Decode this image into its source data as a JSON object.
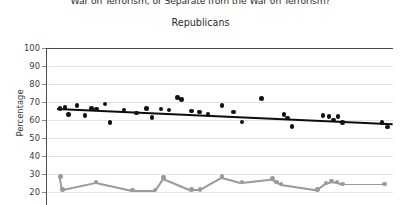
{
  "chart_data": {
    "type": "scatter",
    "title": "War on Terrorism, or Separate from the War on Terrorism?",
    "subtitle": "Republicans",
    "xlabel": "",
    "ylabel": "Percentage",
    "ylim": [
      20,
      100
    ],
    "yticks": [
      100,
      90,
      80,
      70,
      60,
      50,
      40,
      30,
      20
    ],
    "ytick_labels": [
      "100",
      "90",
      "80",
      "70",
      "60",
      "50",
      "40",
      "30",
      "20"
    ],
    "grid": true,
    "legend": "none",
    "series": [
      {
        "name": "part-of-war-on-terrorism",
        "color": "#111111",
        "marker": "circle",
        "trendline": {
          "y_start": 66.5,
          "y_end": 58.0,
          "color": "#0d0d0d"
        },
        "points": [
          {
            "x": 0.5,
            "y": 66.5
          },
          {
            "x": 1.4,
            "y": 67.0
          },
          {
            "x": 2.1,
            "y": 63.0
          },
          {
            "x": 3.6,
            "y": 68.0
          },
          {
            "x": 5.0,
            "y": 62.5
          },
          {
            "x": 6.2,
            "y": 66.5
          },
          {
            "x": 7.1,
            "y": 66.0
          },
          {
            "x": 8.6,
            "y": 69.0
          },
          {
            "x": 9.5,
            "y": 58.5
          },
          {
            "x": 12.0,
            "y": 65.5
          },
          {
            "x": 14.2,
            "y": 64.0
          },
          {
            "x": 16.0,
            "y": 66.5
          },
          {
            "x": 17.0,
            "y": 61.5
          },
          {
            "x": 18.6,
            "y": 66.0
          },
          {
            "x": 20.0,
            "y": 65.5
          },
          {
            "x": 21.5,
            "y": 72.5
          },
          {
            "x": 22.2,
            "y": 71.5
          },
          {
            "x": 24.0,
            "y": 65.0
          },
          {
            "x": 25.4,
            "y": 64.5
          },
          {
            "x": 27.0,
            "y": 63.0
          },
          {
            "x": 29.5,
            "y": 68.0
          },
          {
            "x": 31.5,
            "y": 64.5
          },
          {
            "x": 33.0,
            "y": 59.0
          },
          {
            "x": 36.5,
            "y": 72.0
          },
          {
            "x": 40.5,
            "y": 63.0
          },
          {
            "x": 41.2,
            "y": 61.0
          },
          {
            "x": 42.0,
            "y": 56.5
          },
          {
            "x": 47.5,
            "y": 62.5
          },
          {
            "x": 48.6,
            "y": 62.0
          },
          {
            "x": 49.4,
            "y": 60.0
          },
          {
            "x": 50.2,
            "y": 62.0
          },
          {
            "x": 51.0,
            "y": 58.5
          },
          {
            "x": 58.0,
            "y": 58.5
          },
          {
            "x": 59.0,
            "y": 56.0
          }
        ]
      },
      {
        "name": "separate-from-war-on-terrorism",
        "color": "#9a9a9a",
        "marker": "circle",
        "trendline": {
          "y_start": 22.0,
          "y_end": 24.5,
          "color": "#9a9a9a"
        },
        "points": [
          {
            "x": 0.6,
            "y": 28.5
          },
          {
            "x": 1.0,
            "y": 21.5
          },
          {
            "x": 7.0,
            "y": 25.5
          },
          {
            "x": 13.5,
            "y": 21.0
          },
          {
            "x": 17.5,
            "y": 21.0
          },
          {
            "x": 19.0,
            "y": 28.0
          },
          {
            "x": 24.0,
            "y": 21.5
          },
          {
            "x": 25.5,
            "y": 21.5
          },
          {
            "x": 29.5,
            "y": 28.5
          },
          {
            "x": 33.0,
            "y": 25.5
          },
          {
            "x": 38.5,
            "y": 27.5
          },
          {
            "x": 39.2,
            "y": 25.5
          },
          {
            "x": 40.0,
            "y": 24.5
          },
          {
            "x": 46.5,
            "y": 21.5
          },
          {
            "x": 48.0,
            "y": 25.0
          },
          {
            "x": 49.0,
            "y": 26.0
          },
          {
            "x": 50.0,
            "y": 25.5
          },
          {
            "x": 51.0,
            "y": 24.5
          },
          {
            "x": 58.5,
            "y": 24.5
          }
        ]
      }
    ]
  }
}
